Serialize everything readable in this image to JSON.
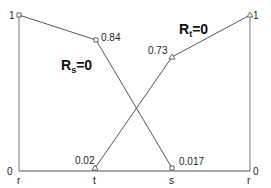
{
  "diagram": {
    "axes": {
      "left_top_label": "1",
      "left_bottom_label": "0",
      "right_top_label": "1",
      "right_bottom_label": "0"
    },
    "x_labels": {
      "r_left": "r",
      "t": "t",
      "s": "s",
      "r_right": "r"
    },
    "series": [
      {
        "name": "R_s=0",
        "label_main": "R",
        "label_sub": "s",
        "label_rest": "=0",
        "marker": "square",
        "points": [
          {
            "pos": "r",
            "value": 1,
            "label": ""
          },
          {
            "pos": "t",
            "value": 0.84,
            "label": "0.84"
          },
          {
            "pos": "s",
            "value": 0.017,
            "label": "0.017"
          }
        ]
      },
      {
        "name": "R_t=0",
        "label_main": "R",
        "label_sub": "t",
        "label_rest": "=0",
        "marker": "triangle",
        "points": [
          {
            "pos": "t",
            "value": 0.02,
            "label": "0.02"
          },
          {
            "pos": "s",
            "value": 0.73,
            "label": "0.73"
          },
          {
            "pos": "r",
            "value": 1,
            "label": ""
          }
        ]
      }
    ],
    "colors": {
      "line": "#555555",
      "text": "#222222"
    }
  }
}
